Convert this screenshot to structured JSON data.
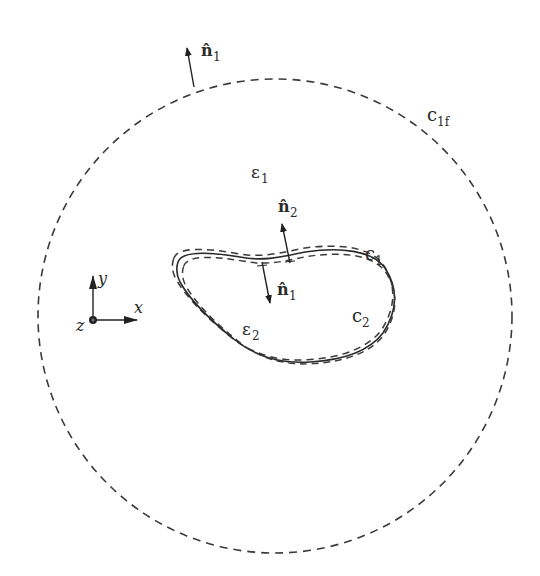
{
  "diagram": {
    "type": "two-region electromagnetic domain with boundary contours",
    "colors": {
      "stroke": "#3a3a3a",
      "background": "#ffffff"
    },
    "outer_contour": {
      "label": "c",
      "label_sub": "1f",
      "style": "dashed circle"
    },
    "outer_normal": {
      "label": "n̂",
      "label_sub": "1"
    },
    "region_outer": {
      "label": "ε",
      "label_sub": "1"
    },
    "region_inner": {
      "label": "ε",
      "label_sub": "2"
    },
    "inner_contour_outer": {
      "label": "c",
      "label_sub": "1"
    },
    "inner_contour_inner": {
      "label": "c",
      "label_sub": "2"
    },
    "normal_outward": {
      "label": "n̂",
      "label_sub": "2"
    },
    "normal_inward": {
      "label": "n̂",
      "label_sub": "1"
    },
    "axes": {
      "x": "x",
      "y": "y",
      "z": "z"
    }
  }
}
